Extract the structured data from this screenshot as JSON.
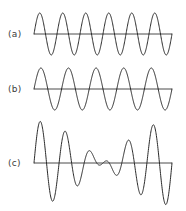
{
  "figure": {
    "background_color": "#ffffff",
    "stroke_color": "#2a2a2a",
    "axis_color": "#4a4a4a",
    "label_color": "#3a3a3a",
    "width": 186,
    "height": 211
  },
  "panels": [
    {
      "label": "(a)",
      "label_x": 8,
      "label_y": 29,
      "baseline_y": 34,
      "x_start": 34,
      "x_end": 172,
      "amplitude": 21
    },
    {
      "label": "(b)",
      "label_x": 8,
      "label_y": 84,
      "baseline_y": 89,
      "x_start": 34,
      "x_end": 172,
      "amplitude": 21
    },
    {
      "label": "(c)",
      "label_x": 8,
      "label_y": 158,
      "baseline_y": 163,
      "x_start": 34,
      "x_end": 172,
      "amplitude": 42
    }
  ],
  "chart_data": {
    "type": "line",
    "title": "",
    "xlabel": "",
    "ylabel": "",
    "grid": false,
    "legend": "none",
    "x": [
      0,
      1
    ],
    "xlim": [
      0,
      1
    ],
    "series": [
      {
        "name": "(a)",
        "panel": 0,
        "waveform": "sine",
        "cycles": 6,
        "amplitude": 1,
        "phase_deg": 0,
        "ylim": [
          -1,
          1
        ]
      },
      {
        "name": "(b)",
        "panel": 1,
        "waveform": "sine",
        "cycles": 5,
        "amplitude": 1,
        "phase_deg": 0,
        "ylim": [
          -1,
          1
        ]
      },
      {
        "name": "(c)",
        "panel": 2,
        "waveform": "sum",
        "components": [
          {
            "cycles": 6,
            "amplitude": 1,
            "phase_deg": 0
          },
          {
            "cycles": 5,
            "amplitude": 1,
            "phase_deg": 0
          }
        ],
        "amplitude": 2,
        "ylim": [
          -2,
          2
        ]
      }
    ]
  }
}
